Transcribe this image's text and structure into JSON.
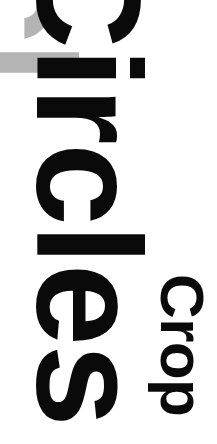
{
  "canvas": {
    "width": 217,
    "height": 444,
    "background_color": "#ffffff"
  },
  "main_word": {
    "text": "Circles",
    "color": "#0a0a0a",
    "rotation_degrees": 90,
    "cropped": true
  },
  "ghost_word": {
    "text": "Circles",
    "color": "#b4b4b4",
    "rotation_degrees": 90,
    "cropped": true
  },
  "label": {
    "text": "Crop",
    "color": "#0a0a0a",
    "rotation_degrees": 90
  }
}
